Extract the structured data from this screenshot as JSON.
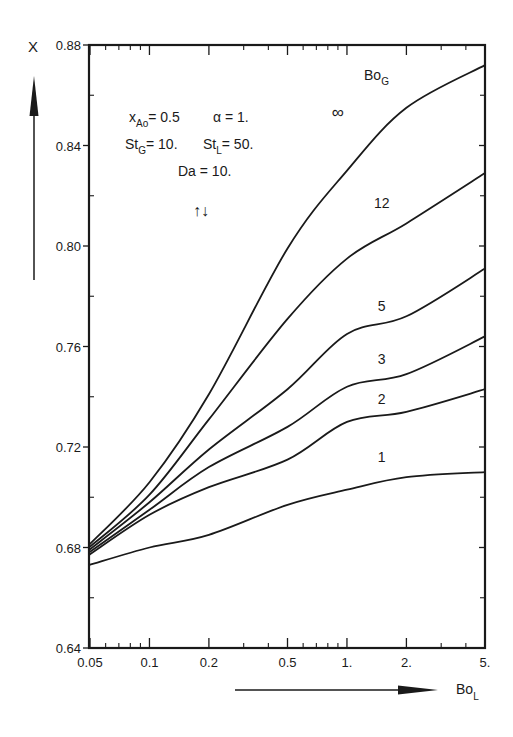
{
  "chart_data": {
    "type": "line",
    "title": "",
    "xlabel": "Bo",
    "xlabel_sub": "L",
    "ylabel": "X",
    "xscale": "log",
    "xlim": [
      0.045,
      5.0
    ],
    "ylim": [
      0.64,
      0.88
    ],
    "grid": false,
    "x_ticks": [
      {
        "value": 0.05,
        "label": "0.05"
      },
      {
        "value": 0.1,
        "label": "0.1"
      },
      {
        "value": 0.2,
        "label": "0.2"
      },
      {
        "value": 0.5,
        "label": "0.5"
      },
      {
        "value": 1.0,
        "label": "1."
      },
      {
        "value": 2.0,
        "label": "2."
      },
      {
        "value": 5.0,
        "label": "5."
      }
    ],
    "y_ticks": [
      {
        "value": 0.64,
        "label": "0.64"
      },
      {
        "value": 0.68,
        "label": "0.68"
      },
      {
        "value": 0.72,
        "label": "0.72"
      },
      {
        "value": 0.76,
        "label": "0.76"
      },
      {
        "value": 0.8,
        "label": "0.80"
      },
      {
        "value": 0.84,
        "label": "0.84"
      },
      {
        "value": 0.88,
        "label": "0.88"
      }
    ],
    "legend_title": "Bo",
    "legend_title_sub": "G",
    "x": [
      0.045,
      0.1,
      0.2,
      0.5,
      1.0,
      2.0,
      5.0
    ],
    "series": [
      {
        "name": "∞",
        "values": [
          0.681,
          0.706,
          0.741,
          0.799,
          0.83,
          0.855,
          0.872
        ],
        "label_at": [
          0.9,
          0.851
        ]
      },
      {
        "name": "12",
        "values": [
          0.68,
          0.701,
          0.731,
          0.771,
          0.795,
          0.809,
          0.829
        ],
        "label_at": [
          1.5,
          0.815
        ]
      },
      {
        "name": "5",
        "values": [
          0.679,
          0.698,
          0.719,
          0.743,
          0.765,
          0.772,
          0.791
        ],
        "label_at": [
          1.5,
          0.774
        ]
      },
      {
        "name": "3",
        "values": [
          0.678,
          0.695,
          0.712,
          0.728,
          0.744,
          0.749,
          0.764
        ],
        "label_at": [
          1.5,
          0.753
        ]
      },
      {
        "name": "2",
        "values": [
          0.677,
          0.693,
          0.704,
          0.715,
          0.73,
          0.734,
          0.743
        ],
        "label_at": [
          1.5,
          0.737
        ]
      },
      {
        "name": "1",
        "values": [
          0.673,
          0.68,
          0.685,
          0.697,
          0.703,
          0.708,
          0.71
        ],
        "label_at": [
          1.5,
          0.714
        ]
      }
    ],
    "annotations": [
      {
        "text": "x_Ao = 0.5"
      },
      {
        "text": "α = 1."
      },
      {
        "text": "St_G = 10."
      },
      {
        "text": "St_L = 50."
      },
      {
        "text": "Da = 10."
      },
      {
        "text": "↑↓"
      }
    ]
  },
  "labels": {
    "y_axis": "X",
    "x_axis_main": "Bo",
    "x_axis_sub": "L",
    "legend_main": "Bo",
    "legend_sub": "G",
    "param_xao_main": "x",
    "param_xao_sub": "Ao",
    "param_xao_val": "= 0.5",
    "param_alpha": "α = 1.",
    "param_stg_main": "St",
    "param_stg_sub": "G",
    "param_stg_val": "= 10.",
    "param_stl_main": "St",
    "param_stl_sub": "L",
    "param_stl_val": "= 50.",
    "param_da": "Da = 10.",
    "flow_arrows": "↑↓"
  }
}
